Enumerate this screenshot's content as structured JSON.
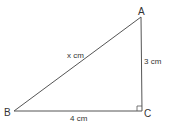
{
  "diagram": {
    "type": "right-triangle",
    "vertices": {
      "A": {
        "label": "A",
        "x": 141,
        "y": 17
      },
      "B": {
        "label": "B",
        "x": 14,
        "y": 111
      },
      "C": {
        "label": "C",
        "x": 142,
        "y": 111
      }
    },
    "sides": {
      "AB": {
        "label": "x cm"
      },
      "AC": {
        "label": "3 cm"
      },
      "BC": {
        "label": "4 cm"
      }
    },
    "right_angle_at": "C",
    "colors": {
      "line": "#555555",
      "text": "#333333",
      "background": "#ffffff"
    }
  }
}
